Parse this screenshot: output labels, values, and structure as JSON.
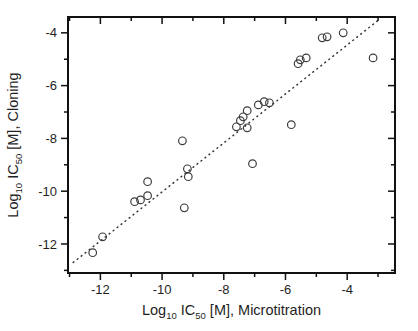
{
  "figure": {
    "width": 418,
    "height": 331,
    "background": "#ffffff"
  },
  "chart_data": {
    "type": "scatter",
    "title": "",
    "xlabel": "Log10 IC50 [M], Microtitration",
    "ylabel": "Log10 IC50 [M], Cloning",
    "xlabel_parts": [
      {
        "t": "Log",
        "sub": false
      },
      {
        "t": "10",
        "sub": true
      },
      {
        "t": " IC",
        "sub": false
      },
      {
        "t": "50",
        "sub": true
      },
      {
        "t": " [M], Microtitration",
        "sub": false
      }
    ],
    "ylabel_parts": [
      {
        "t": "Log",
        "sub": false
      },
      {
        "t": "10",
        "sub": true
      },
      {
        "t": " IC",
        "sub": false
      },
      {
        "t": "50",
        "sub": true
      },
      {
        "t": " [M], Cloning",
        "sub": false
      }
    ],
    "xlim": [
      -13.05,
      -2.45
    ],
    "ylim": [
      -13.1,
      -3.4
    ],
    "x_major_ticks": [
      -12,
      -10,
      -8,
      -6,
      -4
    ],
    "x_tick_labels": [
      "-12",
      "-10",
      "-8",
      "-6",
      "-4"
    ],
    "x_minor_ticks": [
      -13,
      -11,
      -9,
      -7,
      -5,
      -3
    ],
    "y_major_ticks": [
      -12,
      -10,
      -8,
      -6,
      -4
    ],
    "y_tick_labels": [
      "-12",
      "-10",
      "-8",
      "-6",
      "-4"
    ],
    "y_minor_ticks": [
      -13,
      -11,
      -9,
      -7,
      -5
    ],
    "grid": false,
    "legend": "none",
    "marker": {
      "shape": "open-circle",
      "radius": 3.8,
      "stroke_color": "#3d3d3d",
      "stroke_width": 1.2
    },
    "frame_color": "#111111",
    "fit_line": {
      "style": "dotted",
      "color": "#333333",
      "x1": -12.88,
      "y1": -12.7,
      "x2": -3.02,
      "y2": -3.55
    },
    "points": [
      [
        -12.25,
        -12.33
      ],
      [
        -11.93,
        -11.73
      ],
      [
        -10.89,
        -10.4
      ],
      [
        -10.7,
        -10.33
      ],
      [
        -10.47,
        -10.17
      ],
      [
        -10.47,
        -9.64
      ],
      [
        -9.34,
        -8.09
      ],
      [
        -9.28,
        -10.63
      ],
      [
        -9.18,
        -9.15
      ],
      [
        -9.15,
        -9.45
      ],
      [
        -7.59,
        -7.56
      ],
      [
        -7.46,
        -7.33
      ],
      [
        -7.37,
        -7.18
      ],
      [
        -7.24,
        -7.6
      ],
      [
        -7.24,
        -6.95
      ],
      [
        -7.07,
        -8.96
      ],
      [
        -6.88,
        -6.73
      ],
      [
        -6.69,
        -6.61
      ],
      [
        -6.52,
        -6.65
      ],
      [
        -5.81,
        -7.48
      ],
      [
        -5.59,
        -5.17
      ],
      [
        -5.52,
        -5.02
      ],
      [
        -5.33,
        -4.95
      ],
      [
        -4.81,
        -4.19
      ],
      [
        -4.65,
        -4.15
      ],
      [
        -4.13,
        -4.0
      ],
      [
        -3.16,
        -4.95
      ]
    ]
  }
}
